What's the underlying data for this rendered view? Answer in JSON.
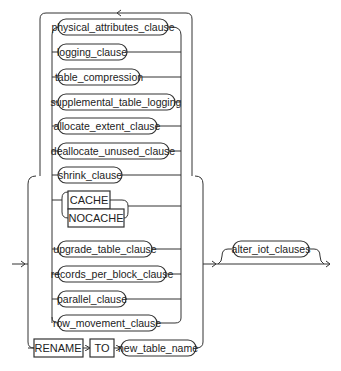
{
  "diagram": {
    "type": "railroad-syntax-diagram",
    "repeat_group": {
      "items": [
        {
          "label": "physical_attributes_clause",
          "kind": "nonterminal"
        },
        {
          "label": "logging_clause",
          "kind": "nonterminal"
        },
        {
          "label": "table_compression",
          "kind": "nonterminal"
        },
        {
          "label": "supplemental_table_logging",
          "kind": "nonterminal"
        },
        {
          "label": "allocate_extent_clause",
          "kind": "nonterminal"
        },
        {
          "label": "deallocate_unused_clause",
          "kind": "nonterminal"
        },
        {
          "label": "shrink_clause",
          "kind": "nonterminal"
        }
      ]
    },
    "cache_choice": {
      "items": [
        {
          "label": "CACHE",
          "kind": "keyword"
        },
        {
          "label": "NOCACHE",
          "kind": "keyword"
        }
      ]
    },
    "more_items": [
      {
        "label": "upgrade_table_clause",
        "kind": "nonterminal"
      },
      {
        "label": "records_per_block_clause",
        "kind": "nonterminal"
      },
      {
        "label": "parallel_clause",
        "kind": "nonterminal"
      },
      {
        "label": "row_movement_clause",
        "kind": "nonterminal"
      }
    ],
    "rename_path": {
      "rename_kw": "RENAME",
      "to_kw": "TO",
      "target": "new_table_name"
    },
    "optional_tail": {
      "label": "alter_iot_clauses",
      "kind": "nonterminal"
    }
  }
}
